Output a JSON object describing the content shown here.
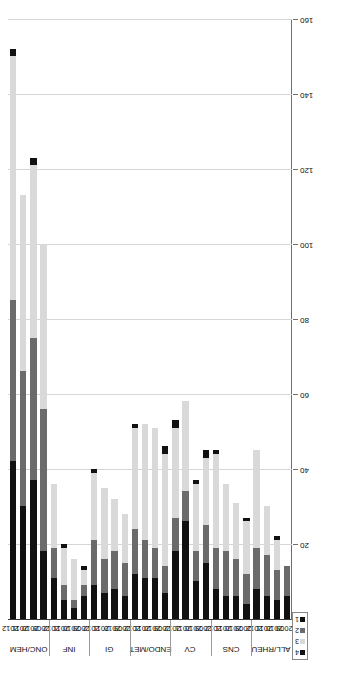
{
  "chart_data": {
    "type": "bar",
    "orientation": "horizontal-stacked",
    "title": "",
    "xlabel": "",
    "ylabel": "",
    "value_axis": {
      "min": 0,
      "max": 160,
      "ticks": [
        0,
        20,
        40,
        60,
        80,
        100,
        120,
        140,
        160
      ],
      "tick_labels": [
        "0",
        "20",
        "40",
        "60",
        "80",
        "100",
        "120",
        "140",
        "160"
      ],
      "grid": true
    },
    "legend": {
      "position": "bottom-left",
      "title": "",
      "entries": [
        {
          "label": "1",
          "color": "#111111"
        },
        {
          "label": "2",
          "color": "#6b6b6b"
        },
        {
          "label": "3",
          "color": "#d9d9d9"
        },
        {
          "label": "4",
          "color": "#111111"
        }
      ]
    },
    "series": [
      {
        "name": "1",
        "color": "#111111"
      },
      {
        "name": "2",
        "color": "#6b6b6b"
      },
      {
        "name": "3",
        "color": "#d9d9d9"
      },
      {
        "name": "4",
        "color": "#111111"
      }
    ],
    "group_label_key": "therapeutic_area",
    "category_label_key": "year",
    "groups": [
      {
        "therapeutic_area": "ALL/RHEU",
        "bars": [
          {
            "year": "2009",
            "values": [
              6,
              8,
              0,
              0
            ],
            "total": 14
          },
          {
            "year": "2010",
            "values": [
              5,
              8,
              8,
              1
            ],
            "total": 22
          },
          {
            "year": "2011",
            "values": [
              6,
              11,
              13,
              0
            ],
            "total": 30
          },
          {
            "year": "2012",
            "values": [
              8,
              11,
              26,
              0
            ],
            "total": 45
          }
        ]
      },
      {
        "therapeutic_area": "CNS",
        "bars": [
          {
            "year": "2009",
            "values": [
              4,
              8,
              14,
              1
            ],
            "total": 27
          },
          {
            "year": "2010",
            "values": [
              6,
              10,
              15,
              0
            ],
            "total": 31
          },
          {
            "year": "2011",
            "values": [
              6,
              12,
              18,
              0
            ],
            "total": 36
          },
          {
            "year": "2012",
            "values": [
              8,
              11,
              25,
              1
            ],
            "total": 45
          }
        ]
      },
      {
        "therapeutic_area": "CV",
        "bars": [
          {
            "year": "2009",
            "values": [
              15,
              10,
              18,
              2
            ],
            "total": 45
          },
          {
            "year": "2010",
            "values": [
              10,
              8,
              18,
              1
            ],
            "total": 37
          },
          {
            "year": "2011",
            "values": [
              26,
              8,
              24,
              0
            ],
            "total": 58
          },
          {
            "year": "2012",
            "values": [
              18,
              9,
              24,
              2
            ],
            "total": 53
          }
        ]
      },
      {
        "therapeutic_area": "ENDO/MET",
        "bars": [
          {
            "year": "2009",
            "values": [
              7,
              7,
              30,
              2
            ],
            "total": 46
          },
          {
            "year": "2010",
            "values": [
              11,
              8,
              32,
              0
            ],
            "total": 51
          },
          {
            "year": "2011",
            "values": [
              11,
              10,
              31,
              0
            ],
            "total": 52
          },
          {
            "year": "2012",
            "values": [
              12,
              12,
              27,
              1
            ],
            "total": 52
          }
        ]
      },
      {
        "therapeutic_area": "GI",
        "bars": [
          {
            "year": "2009",
            "values": [
              6,
              9,
              13,
              0
            ],
            "total": 28
          },
          {
            "year": "2010",
            "values": [
              8,
              10,
              14,
              0
            ],
            "total": 32
          },
          {
            "year": "2011",
            "values": [
              7,
              9,
              19,
              0
            ],
            "total": 35
          },
          {
            "year": "2012",
            "values": [
              9,
              12,
              18,
              1
            ],
            "total": 40
          }
        ]
      },
      {
        "therapeutic_area": "INF",
        "bars": [
          {
            "year": "2009",
            "values": [
              6,
              3,
              4,
              1
            ],
            "total": 14
          },
          {
            "year": "2010",
            "values": [
              3,
              2,
              11,
              0
            ],
            "total": 16
          },
          {
            "year": "2011",
            "values": [
              5,
              4,
              10,
              1
            ],
            "total": 20
          },
          {
            "year": "2012",
            "values": [
              11,
              8,
              17,
              0
            ],
            "total": 36
          }
        ]
      },
      {
        "therapeutic_area": "ONC/HEM",
        "bars": [
          {
            "year": "2009",
            "values": [
              18,
              38,
              44,
              0
            ],
            "total": 100
          },
          {
            "year": "2010",
            "values": [
              37,
              38,
              46,
              2
            ],
            "total": 123
          },
          {
            "year": "2011",
            "values": [
              30,
              36,
              47,
              0
            ],
            "total": 113
          },
          {
            "year": "2012",
            "values": [
              42,
              43,
              65,
              2
            ],
            "total": 152
          }
        ]
      }
    ]
  }
}
